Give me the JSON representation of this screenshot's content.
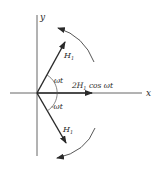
{
  "diagram": {
    "type": "phasor-diagram",
    "axes": {
      "x_label": "x",
      "y_label": "y"
    },
    "vectors": [
      {
        "name": "upper",
        "label": "H",
        "subscript": "1",
        "angle_label": "ωt"
      },
      {
        "name": "lower",
        "label": "H",
        "subscript": "1",
        "angle_label": "-ωt"
      },
      {
        "name": "resultant",
        "label_prefix": "2H",
        "subscript": "1",
        "label_suffix": " cos ωt"
      }
    ],
    "rotation_arrows": [
      "counterclockwise",
      "clockwise"
    ],
    "colors": {
      "ink": "#2a2a2a",
      "background": "#ffffff"
    }
  }
}
